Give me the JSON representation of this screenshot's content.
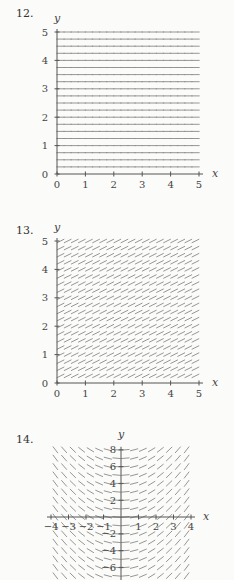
{
  "problems": [
    {
      "number": "12."
    },
    {
      "number": "13."
    },
    {
      "number": "14."
    }
  ],
  "chart_data": [
    {
      "type": "slope_field",
      "problem": "12.",
      "title": "",
      "xlabel": "x",
      "ylabel": "y",
      "xlim": [
        0,
        5
      ],
      "ylim": [
        0,
        5
      ],
      "x_ticks": [
        "0",
        "1",
        "2",
        "3",
        "4",
        "5"
      ],
      "y_ticks": [
        "0",
        "1",
        "2",
        "3",
        "4",
        "5"
      ],
      "slope": "0 everywhere (horizontal segments)",
      "grid_spacing": {
        "x": 0.25,
        "y": 0.25
      },
      "color": "#8a8a8a"
    },
    {
      "type": "slope_field",
      "problem": "13.",
      "title": "",
      "xlabel": "x",
      "ylabel": "y",
      "xlim": [
        0,
        5
      ],
      "ylim": [
        0,
        5
      ],
      "x_ticks": [
        "0",
        "1",
        "2",
        "3",
        "4",
        "5"
      ],
      "y_ticks": [
        "0",
        "1",
        "2",
        "3",
        "4",
        "5"
      ],
      "slope": "constant positive (~0.5) everywhere",
      "grid_spacing": {
        "x": 0.25,
        "y": 0.25
      },
      "color": "#8a8a8a"
    },
    {
      "type": "slope_field",
      "problem": "14.",
      "title": "",
      "xlabel": "x",
      "ylabel": "y",
      "xlim": [
        -4,
        4
      ],
      "ylim": [
        -8,
        8
      ],
      "x_ticks": [
        "-4",
        "-3",
        "-2",
        "-1",
        "1",
        "2",
        "3",
        "4"
      ],
      "y_ticks": [
        "8",
        "6",
        "4",
        "2",
        "-2",
        "-4",
        "-6"
      ],
      "slope": "proportional to x (zero on y-axis, negative for x<0, positive for x>0)",
      "grid_spacing": {
        "x": 0.5,
        "y": 1
      },
      "color": "#8a8a8a"
    }
  ]
}
